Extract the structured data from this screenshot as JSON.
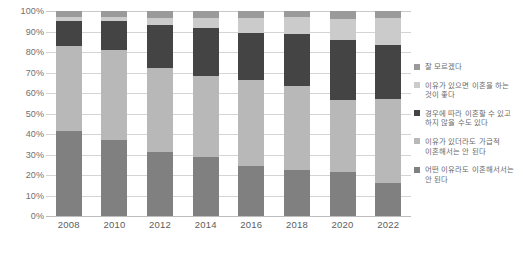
{
  "chart_data": {
    "type": "bar",
    "stacked": true,
    "normalized_percent": true,
    "title": "",
    "subtitle": "",
    "xlabel": "",
    "ylabel": "",
    "ylim": [
      0,
      100
    ],
    "grid": true,
    "legend_position": "right",
    "categories": [
      "2008",
      "2010",
      "2012",
      "2014",
      "2016",
      "2018",
      "2020",
      "2022"
    ],
    "ytick_labels": [
      "0%",
      "10%",
      "20%",
      "30%",
      "40%",
      "50%",
      "60%",
      "70%",
      "80%",
      "90%",
      "100%"
    ],
    "ytick_values": [
      0,
      10,
      20,
      30,
      40,
      50,
      60,
      70,
      80,
      90,
      100
    ],
    "series": [
      {
        "name": "어떤 이유라도 이혼해서서는\n안 된다",
        "color": "#808080",
        "values": [
          41.5,
          37.0,
          31.0,
          29.0,
          24.5,
          22.5,
          21.5,
          16.0
        ]
      },
      {
        "name": "이유가 있더라도 가급적\n이혼해서는 안 된다",
        "color": "#b8b8b8",
        "values": [
          41.5,
          44.0,
          41.0,
          39.5,
          42.0,
          41.0,
          35.0,
          41.0
        ]
      },
      {
        "name": "경우에 따라 이혼할 수 있고\n하지 않을 수도 있다",
        "color": "#444444",
        "values": [
          12.0,
          14.0,
          21.0,
          23.0,
          23.0,
          25.5,
          29.5,
          26.5
        ]
      },
      {
        "name": "이유가 있으면 이혼을 하는\n것이 좋다",
        "color": "#cbcbcb",
        "values": [
          2.0,
          2.0,
          3.5,
          5.0,
          7.0,
          8.0,
          10.0,
          13.0
        ]
      },
      {
        "name": "잘 모르겠다",
        "color": "#9a9a9a",
        "values": [
          3.0,
          3.0,
          3.5,
          3.5,
          3.5,
          3.0,
          4.0,
          3.5
        ]
      }
    ]
  },
  "colors": {
    "gridline": "#d4d4d4",
    "axis_text": "#6f6f6f",
    "legend_text": "#6a6a6a",
    "background": "#ffffff"
  }
}
